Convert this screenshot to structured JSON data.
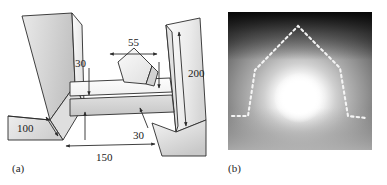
{
  "figure": {
    "panels": [
      {
        "id": "a",
        "caption": "(a)",
        "type": "schematic-drawing",
        "description": "Three-dimensional line drawing of a micro-machined structure consisting of two tilted side blocks flanking a horizontal beam, with a pentagonal (diamond) element resting on the beam.",
        "dimensions": [
          {
            "name": "top-width",
            "value": "55",
            "orientation": "horizontal",
            "x": 133,
            "y": 44
          },
          {
            "name": "beam-thickness",
            "value": "30",
            "orientation": "vertical",
            "x": 79,
            "y": 70
          },
          {
            "name": "block-height",
            "value": "200",
            "orientation": "diagonal",
            "x": 183,
            "y": 74
          },
          {
            "name": "block-depth",
            "value": "100",
            "orientation": "horizontal",
            "x": 40,
            "y": 131
          },
          {
            "name": "gap-thickness",
            "value": "30",
            "orientation": "vertical",
            "x": 139,
            "y": 131
          },
          {
            "name": "overall-width",
            "value": "150",
            "orientation": "horizontal",
            "x": 103,
            "y": 154
          }
        ]
      },
      {
        "id": "b",
        "caption": "(b)",
        "type": "micrograph-photo",
        "description": "Grayscale micrograph showing a bright luminous spot surrounded by a diffuse halo, with a dashed white outline tracing a pentagonal house-shaped boundary.",
        "overlay": {
          "style": "dashed",
          "color": "#f2f2f2",
          "shape": "pentagon-outline"
        }
      }
    ]
  },
  "colors": {
    "line": "#2b2b2b",
    "face_light": "#f1f1f1",
    "face_mid": "#d9d9d9",
    "face_dark": "#bdbdbd",
    "dash_overlay": "#f2f2f2",
    "paper": "#ffffff"
  }
}
